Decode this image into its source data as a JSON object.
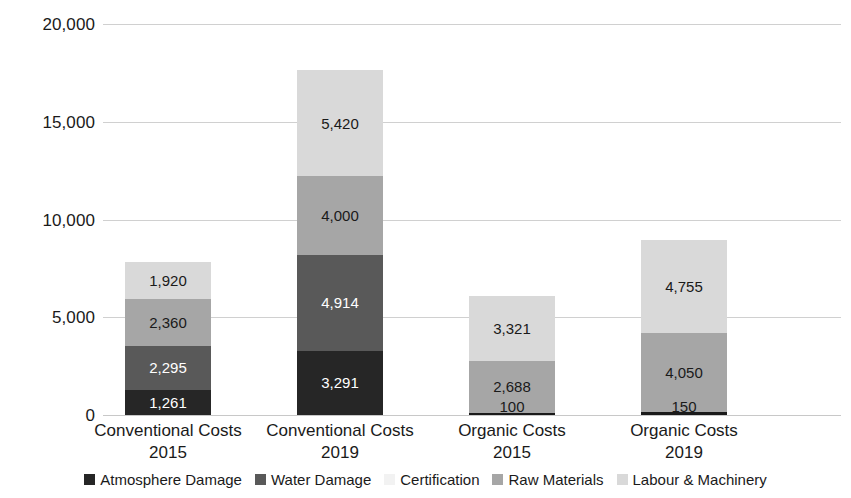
{
  "chart_data": {
    "type": "bar",
    "subtype": "stacked-bar",
    "title": "",
    "xlabel": "",
    "ylabel": "",
    "ylim": [
      0,
      20000
    ],
    "ytick_values": [
      0,
      5000,
      10000,
      15000,
      20000
    ],
    "ytick_labels": [
      "0",
      "5,000",
      "10,000",
      "15,000",
      "20,000"
    ],
    "grid": true,
    "legend_position": "bottom",
    "categories": [
      "Conventional Costs 2015",
      "Conventional Costs 2019",
      "Organic Costs 2015",
      "Organic Costs 2019"
    ],
    "category_lines": [
      {
        "line1": "Conventional Costs",
        "line2": "2015"
      },
      {
        "line1": "Conventional Costs",
        "line2": "2019"
      },
      {
        "line1": "Organic Costs",
        "line2": "2015"
      },
      {
        "line1": "Organic Costs",
        "line2": "2019"
      }
    ],
    "series": [
      {
        "name": "Atmosphere Damage",
        "color": "#262626",
        "values": [
          1261,
          3291,
          100,
          150
        ]
      },
      {
        "name": "Water Damage",
        "color": "#595959",
        "values": [
          2295,
          4914,
          0,
          0
        ]
      },
      {
        "name": "Certification",
        "color": "#f2f2f2",
        "values": [
          0,
          0,
          0,
          0
        ]
      },
      {
        "name": "Raw Materials",
        "color": "#a6a6a6",
        "values": [
          2360,
          4000,
          2688,
          4050
        ]
      },
      {
        "name": "Labour & Machinery",
        "color": "#d9d9d9",
        "values": [
          1920,
          5420,
          3321,
          4755
        ]
      }
    ],
    "totals": [
      7836,
      17625,
      6109,
      8955
    ],
    "bars": [
      {
        "category": "Conventional Costs 2015",
        "segments": [
          {
            "series": "Atmosphere Damage",
            "value": 1261,
            "label": "1,261",
            "color": "#262626",
            "text_color": "light"
          },
          {
            "series": "Water Damage",
            "value": 2295,
            "label": "2,295",
            "color": "#595959",
            "text_color": "light"
          },
          {
            "series": "Raw Materials",
            "value": 2360,
            "label": "2,360",
            "color": "#a6a6a6",
            "text_color": "dark"
          },
          {
            "series": "Labour & Machinery",
            "value": 1920,
            "label": "1,920",
            "color": "#d9d9d9",
            "text_color": "dark"
          }
        ]
      },
      {
        "category": "Conventional Costs 2019",
        "segments": [
          {
            "series": "Atmosphere Damage",
            "value": 3291,
            "label": "3,291",
            "color": "#262626",
            "text_color": "light"
          },
          {
            "series": "Water Damage",
            "value": 4914,
            "label": "4,914",
            "color": "#595959",
            "text_color": "light"
          },
          {
            "series": "Raw Materials",
            "value": 4000,
            "label": "4,000",
            "color": "#a6a6a6",
            "text_color": "dark"
          },
          {
            "series": "Labour & Machinery",
            "value": 5420,
            "label": "5,420",
            "color": "#d9d9d9",
            "text_color": "dark"
          }
        ]
      },
      {
        "category": "Organic Costs 2015",
        "segments": [
          {
            "series": "Atmosphere Damage",
            "value": 100,
            "label": "100",
            "color": "#1a1a1a",
            "text_color": "dark",
            "label_overflow": true
          },
          {
            "series": "Raw Materials",
            "value": 2688,
            "label": "2,688",
            "color": "#a6a6a6",
            "text_color": "dark"
          },
          {
            "series": "Labour & Machinery",
            "value": 3321,
            "label": "3,321",
            "color": "#d9d9d9",
            "text_color": "dark"
          }
        ]
      },
      {
        "category": "Organic Costs 2019",
        "segments": [
          {
            "series": "Atmosphere Damage",
            "value": 150,
            "label": "150",
            "color": "#1a1a1a",
            "text_color": "dark",
            "label_overflow": true
          },
          {
            "series": "Raw Materials",
            "value": 4050,
            "label": "4,050",
            "color": "#a6a6a6",
            "text_color": "dark"
          },
          {
            "series": "Labour & Machinery",
            "value": 4755,
            "label": "4,755",
            "color": "#d9d9d9",
            "text_color": "dark"
          }
        ]
      }
    ],
    "legend": [
      {
        "label": "Atmosphere Damage",
        "color": "#262626"
      },
      {
        "label": "Water Damage",
        "color": "#595959"
      },
      {
        "label": "Certification",
        "color": "#f2f2f2"
      },
      {
        "label": "Raw Materials",
        "color": "#a6a6a6"
      },
      {
        "label": "Labour & Machinery",
        "color": "#d9d9d9"
      }
    ]
  }
}
